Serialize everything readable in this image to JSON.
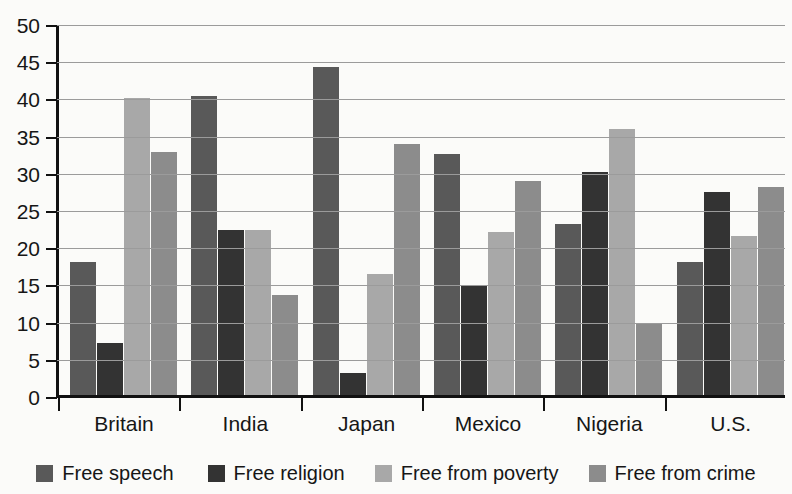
{
  "artifacts": {
    "top_bleed": "      ",
    "bottom_bleed": "    "
  },
  "legend": {
    "position": "bottom-center",
    "items": [
      {
        "label": "Free speech",
        "color": "#595959"
      },
      {
        "label": "Free religion",
        "color": "#333333"
      },
      {
        "label": "Free from poverty",
        "color": "#a8a8a8"
      },
      {
        "label": "Free from crime",
        "color": "#8c8c8c"
      }
    ]
  },
  "chart_data": {
    "type": "bar",
    "title": "",
    "subtitle": "",
    "xlabel": "",
    "ylabel": "",
    "ylim": [
      0,
      50
    ],
    "yticks": [
      0,
      5,
      10,
      15,
      20,
      25,
      30,
      35,
      40,
      45,
      50
    ],
    "ytick_labels": [
      "0",
      "5",
      "10",
      "15",
      "20",
      "25",
      "30",
      "35",
      "40",
      "45",
      "50"
    ],
    "grid": true,
    "grid_axis": "y",
    "categories": [
      "Britain",
      "India",
      "Japan",
      "Mexico",
      "Nigeria",
      "U.S."
    ],
    "series": [
      {
        "name": "Free speech",
        "color": "#595959",
        "values": [
          18.2,
          40.5,
          44.3,
          32.7,
          23.3,
          18.1
        ]
      },
      {
        "name": "Free religion",
        "color": "#333333",
        "values": [
          7.3,
          22.4,
          3.2,
          14.9,
          30.3,
          27.6
        ]
      },
      {
        "name": "Free from poverty",
        "color": "#a8a8a8",
        "values": [
          40.2,
          22.4,
          16.5,
          22.2,
          36.0,
          21.7
        ]
      },
      {
        "name": "Free from crime",
        "color": "#8c8c8c",
        "values": [
          32.9,
          13.7,
          34.0,
          29.0,
          9.9,
          28.2
        ]
      }
    ]
  }
}
